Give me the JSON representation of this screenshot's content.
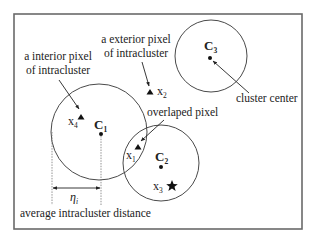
{
  "diagram": {
    "labels": {
      "interior_line1": "a interior pixel",
      "interior_line2": "of intracluster",
      "exterior_line1": "a exterior pixel",
      "exterior_line2": "of intracluster",
      "overlapped": "overlaped pixel",
      "cluster_center": "cluster center",
      "avg_distance": "average intracluster distance"
    },
    "clusters": [
      {
        "id": "C1",
        "base": "C",
        "sub": "1"
      },
      {
        "id": "C2",
        "base": "C",
        "sub": "2"
      },
      {
        "id": "C3",
        "base": "C",
        "sub": "3"
      }
    ],
    "pixels": [
      {
        "id": "x1",
        "base": "x",
        "sub": "1",
        "marker": "triangle"
      },
      {
        "id": "x2",
        "base": "x",
        "sub": "2",
        "marker": "triangle"
      },
      {
        "id": "x3",
        "base": "x",
        "sub": "3",
        "marker": "star"
      },
      {
        "id": "x4",
        "base": "x",
        "sub": "4",
        "marker": "triangle"
      }
    ],
    "distance_symbol": {
      "base": "η",
      "sub": "i"
    },
    "colors": {
      "frame": "#6a6a6a",
      "stroke": "#4a4a4a",
      "text": "#222222"
    }
  }
}
